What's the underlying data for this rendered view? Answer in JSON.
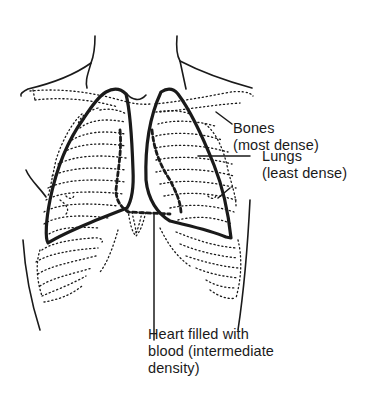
{
  "diagram": {
    "structures": [
      {
        "id": "bones",
        "style": "dotted outline",
        "description": "ribs, clavicles, scapulae"
      },
      {
        "id": "lungs",
        "style": "thick solid outline",
        "description": "left and right lung fields"
      },
      {
        "id": "heart",
        "style": "thick dashed outline",
        "description": "heart border"
      }
    ],
    "colors": {
      "ink": "#1a1a1a",
      "background": "#ffffff"
    }
  },
  "labels": {
    "bones": {
      "line1": "Bones",
      "line2": "(most dense)"
    },
    "lungs": {
      "line1": "Lungs",
      "line2": "(least dense)"
    },
    "heart": {
      "line1": "Heart filled with",
      "line2": "blood (intermediate",
      "line3": "density)"
    }
  }
}
